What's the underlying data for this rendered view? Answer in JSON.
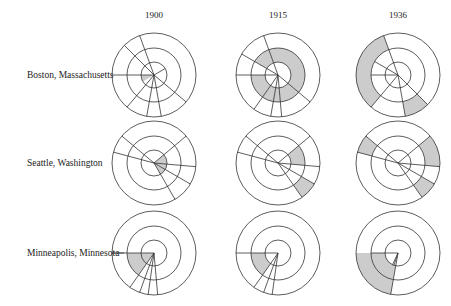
{
  "columns": [
    {
      "label": "1900",
      "cx": 154
    },
    {
      "label": "1915",
      "cx": 278
    },
    {
      "label": "1936",
      "cx": 398
    }
  ],
  "rows": [
    {
      "label": "Boston, Massachusetts",
      "cy": 75,
      "label_y": 75
    },
    {
      "label": "Seattle, Washington",
      "cy": 163,
      "label_y": 163
    },
    {
      "label": "Minneapolis, Minnesota",
      "cy": 253,
      "label_y": 253
    }
  ],
  "rings": [
    13,
    27,
    42
  ],
  "style": {
    "stroke": "#333333",
    "fill_shaded": "#cccccc"
  },
  "charts": [
    [
      {
        "city": "Boston, Massachusetts",
        "year": "1900",
        "lines": [
          [
            180,
            0,
            42
          ],
          [
            225,
            0,
            42
          ],
          [
            250,
            0,
            42
          ],
          [
            40,
            0,
            42
          ],
          [
            80,
            0,
            42
          ],
          [
            130,
            0,
            42
          ],
          [
            -30,
            0,
            13
          ],
          [
            100,
            0,
            42
          ]
        ],
        "shaded": [
          [
            150,
            180,
            0,
            13
          ]
        ]
      },
      {
        "city": "Boston, Massachusetts",
        "year": "1915",
        "lines": [
          [
            180,
            0,
            42
          ],
          [
            210,
            0,
            42
          ],
          [
            250,
            0,
            42
          ],
          [
            40,
            0,
            42
          ],
          [
            85,
            0,
            42
          ],
          [
            125,
            0,
            42
          ],
          [
            100,
            0,
            42
          ]
        ],
        "shaded": [
          [
            210,
            180,
            13,
            27
          ]
        ]
      },
      {
        "city": "Boston, Massachusetts",
        "year": "1936",
        "lines": [
          [
            180,
            0,
            27
          ],
          [
            210,
            0,
            27
          ],
          [
            250,
            0,
            42
          ],
          [
            45,
            0,
            42
          ],
          [
            80,
            0,
            42
          ],
          [
            130,
            0,
            42
          ]
        ],
        "shaded": [
          [
            130,
            250,
            27,
            42
          ],
          [
            45,
            80,
            27,
            42
          ]
        ]
      }
    ],
    [
      {
        "city": "Seattle, Washington",
        "year": "1900",
        "lines": [
          [
            195,
            0,
            42
          ],
          [
            220,
            0,
            42
          ],
          [
            320,
            0,
            42
          ],
          [
            5,
            0,
            42
          ],
          [
            30,
            0,
            42
          ],
          [
            60,
            0,
            42
          ]
        ],
        "shaded": [
          [
            -40,
            60,
            0,
            13
          ]
        ]
      },
      {
        "city": "Seattle, Washington",
        "year": "1915",
        "lines": [
          [
            195,
            0,
            42
          ],
          [
            220,
            0,
            42
          ],
          [
            320,
            0,
            42
          ],
          [
            5,
            0,
            42
          ],
          [
            30,
            0,
            42
          ],
          [
            55,
            0,
            42
          ]
        ],
        "shaded": [
          [
            -40,
            5,
            13,
            27
          ],
          [
            30,
            55,
            27,
            42
          ]
        ]
      },
      {
        "city": "Seattle, Washington",
        "year": "1936",
        "lines": [
          [
            195,
            0,
            42
          ],
          [
            220,
            0,
            42
          ],
          [
            320,
            0,
            42
          ],
          [
            5,
            0,
            42
          ],
          [
            30,
            0,
            42
          ],
          [
            55,
            0,
            42
          ]
        ],
        "shaded": [
          [
            195,
            220,
            27,
            42
          ],
          [
            -40,
            5,
            27,
            42
          ],
          [
            30,
            55,
            27,
            42
          ]
        ]
      }
    ],
    [
      {
        "city": "Minneapolis, Minnesota",
        "year": "1900",
        "lines": [
          [
            180,
            0,
            42
          ],
          [
            125,
            0,
            42
          ],
          [
            110,
            0,
            42
          ],
          [
            98,
            0,
            42
          ],
          [
            85,
            0,
            42
          ]
        ],
        "shaded": [
          [
            125,
            180,
            0,
            27
          ]
        ]
      },
      {
        "city": "Minneapolis, Minnesota",
        "year": "1915",
        "lines": [
          [
            180,
            0,
            42
          ],
          [
            125,
            0,
            42
          ],
          [
            110,
            0,
            42
          ],
          [
            98,
            0,
            42
          ]
        ],
        "shaded": [
          [
            125,
            180,
            13,
            27
          ]
        ]
      },
      {
        "city": "Minneapolis, Minnesota",
        "year": "1936",
        "lines": [
          [
            180,
            0,
            27
          ],
          [
            100,
            0,
            42
          ],
          [
            115,
            0,
            13
          ],
          [
            108,
            0,
            13
          ]
        ],
        "shaded": [
          [
            100,
            180,
            13,
            42
          ]
        ]
      }
    ]
  ]
}
